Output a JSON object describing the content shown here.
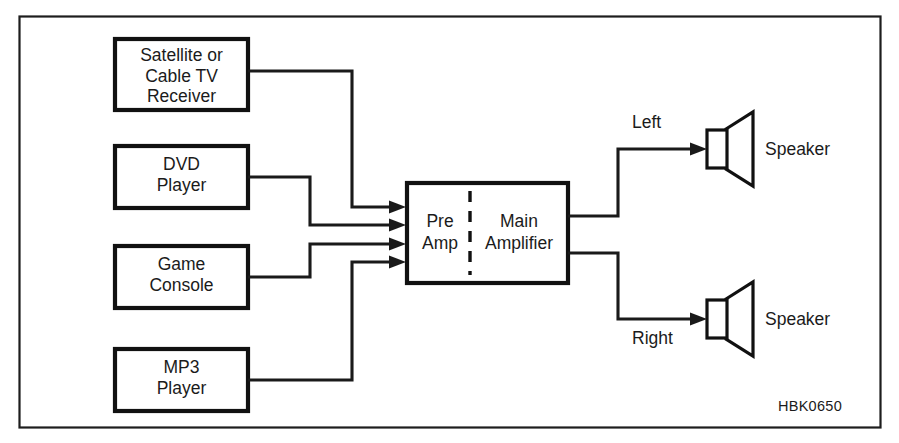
{
  "figure": {
    "code": "HBK0650",
    "frame": {
      "border_color": "#1d1d1d"
    },
    "ink_color": "#1a1a1a"
  },
  "sources": [
    {
      "name": "satellite-cable-tv-receiver",
      "lines": [
        "Satellite or",
        "Cable TV",
        "Receiver"
      ]
    },
    {
      "name": "dvd-player",
      "lines": [
        "DVD",
        "Player"
      ]
    },
    {
      "name": "game-console",
      "lines": [
        "Game",
        "Console"
      ]
    },
    {
      "name": "mp3-player",
      "lines": [
        "MP3",
        "Player"
      ]
    }
  ],
  "amplifier": {
    "preamp": {
      "lines": [
        "Pre",
        "Amp"
      ]
    },
    "main": {
      "lines": [
        "Main",
        "Amplifier"
      ]
    }
  },
  "outputs": [
    {
      "name": "left-channel",
      "channel": "Left",
      "device": "Speaker"
    },
    {
      "name": "right-channel",
      "channel": "Right",
      "device": "Speaker"
    }
  ]
}
